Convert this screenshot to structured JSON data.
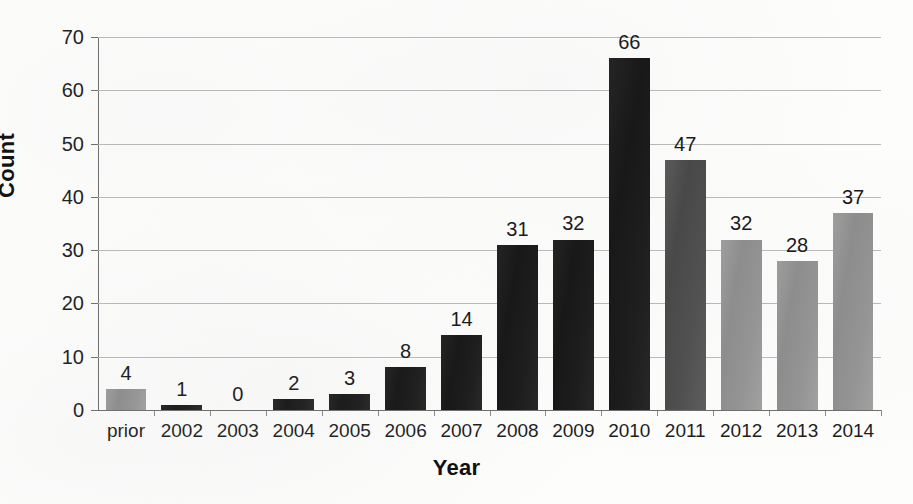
{
  "chart_data": {
    "type": "bar",
    "title": "",
    "xlabel": "Year",
    "ylabel": "Count",
    "categories": [
      "prior",
      "2002",
      "2003",
      "2004",
      "2005",
      "2006",
      "2007",
      "2008",
      "2009",
      "2010",
      "2011",
      "2012",
      "2013",
      "2014"
    ],
    "values": [
      4,
      1,
      0,
      2,
      3,
      8,
      14,
      31,
      32,
      66,
      47,
      32,
      28,
      37
    ],
    "bar_colors": [
      "#949494",
      "#1a1919",
      "#1a1919",
      "#1a1919",
      "#1a1919",
      "#1a1919",
      "#1a1919",
      "#1a1919",
      "#1a1919",
      "#1a1919",
      "#4e4e4e",
      "#949494",
      "#949494",
      "#949494"
    ],
    "bar_tones": [
      "gray",
      "black",
      "black",
      "black",
      "black",
      "black",
      "black",
      "black",
      "black",
      "black",
      "darkgray",
      "gray",
      "gray",
      "gray"
    ],
    "data_labels": [
      "4",
      "1",
      "0",
      "2",
      "3",
      "8",
      "14",
      "31",
      "32",
      "66",
      "47",
      "32",
      "28",
      "37"
    ],
    "ylim": [
      0,
      70
    ],
    "yticks": [
      0,
      10,
      20,
      30,
      40,
      50,
      60,
      70
    ],
    "ytick_labels": [
      "0",
      "10",
      "20",
      "30",
      "40",
      "50",
      "60",
      "70"
    ],
    "grid": true,
    "grid_axis": "y",
    "legend": false,
    "legend_position": "none",
    "show_value_labels": true,
    "background_color": "#fdfdfc",
    "gridline_color": "#b9b9b9",
    "axis_color": "#6d6d6d",
    "text_color": "#1c1c1c"
  }
}
